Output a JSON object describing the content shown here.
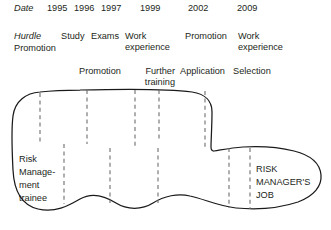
{
  "figure": {
    "rows": {
      "date": {
        "label": "Date",
        "values": [
          "1995",
          "1996",
          "1997",
          "1999",
          "2002",
          "2009"
        ]
      },
      "hurdle": {
        "label": "Hurdle",
        "label_below": "Promotion",
        "values": [
          "Study",
          "Exams",
          "Work experience",
          "Promotion",
          "Work experience"
        ]
      },
      "second_row": {
        "values": [
          "Promotion",
          "Further training",
          "Application",
          "Selection"
        ]
      }
    },
    "blob": {
      "start_label_lines": [
        "Risk",
        "Manage-",
        "ment",
        "trainee"
      ],
      "end_label_lines": [
        "RISK",
        "MANAGER'S",
        "JOB"
      ]
    },
    "colors": {
      "ink": "#231f20",
      "outline": "#1a1a1a",
      "dashed": "#6d6d6d"
    }
  }
}
